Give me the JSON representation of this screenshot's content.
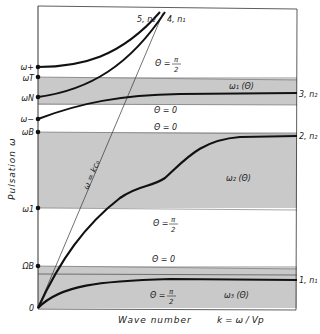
{
  "figure": {
    "ylabel": "Pulsation  ω",
    "xlabel": "Wave number",
    "xlabel_formula": "k = ω / Vp",
    "light_line_label": "ω = kc₀",
    "colors": {
      "band": "#c9c9c9",
      "curve": "#111111",
      "frame": "#333333"
    }
  },
  "y_ticks": [
    {
      "label": "ω+",
      "y": 67
    },
    {
      "label": "ωT",
      "y": 77
    },
    {
      "label": "ωN",
      "y": 97
    },
    {
      "label": "ω−",
      "y": 119
    },
    {
      "label": "ωB",
      "y": 132
    },
    {
      "label": "ω1",
      "y": 208
    },
    {
      "label": "ΩB",
      "y": 266
    },
    {
      "label": "0",
      "y": 308
    }
  ],
  "branches": [
    {
      "id": "5",
      "label": "5, n₂"
    },
    {
      "id": "4",
      "label": "4, n₁"
    },
    {
      "id": "3",
      "label": "3, n₂",
      "name": "ω₁ (Θ)"
    },
    {
      "id": "2",
      "label": "2, n₂",
      "name": "ω₂ (Θ)"
    },
    {
      "id": "1",
      "label": "1, n₁",
      "name": "ω₃ (Θ)"
    }
  ],
  "theta_labels": {
    "top_pi2": "Θ =",
    "mid_zero_a": "Θ = 0",
    "mid_zero_b": "Θ = 0",
    "lower_pi2": "Θ =",
    "lower_zero": "Θ = 0",
    "bottom_pi2": "Θ =",
    "pi": "π",
    "two": "2"
  }
}
